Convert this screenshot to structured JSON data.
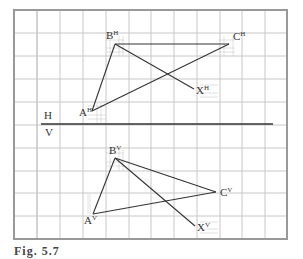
{
  "figure": {
    "colors": {
      "grid": "#c8c8c8",
      "fine_grid": "#cfcfcf",
      "frame": "#999999",
      "ink": "#333333",
      "background": "#ffffff"
    },
    "grid": {
      "x": [
        14,
        37,
        60,
        83,
        106,
        129,
        151,
        174,
        197,
        220,
        242,
        265,
        287
      ],
      "y": [
        10,
        33,
        56,
        79,
        102,
        125,
        148,
        171,
        193,
        216,
        239
      ]
    },
    "folding_line": {
      "x1": 41,
      "y1": 124,
      "x2": 273,
      "y2": 124,
      "upper_label": "H",
      "lower_label": "V"
    },
    "horizontal_view": {
      "points": {
        "A": {
          "x": 92,
          "y": 111,
          "label": "A",
          "sup": "H"
        },
        "B": {
          "x": 115,
          "y": 44,
          "label": "B",
          "sup": "H"
        },
        "C": {
          "x": 229,
          "y": 44,
          "label": "C",
          "sup": "H"
        },
        "X": {
          "x": 194,
          "y": 89,
          "label": "X",
          "sup": "H"
        }
      },
      "segments": [
        [
          "A",
          "B"
        ],
        [
          "B",
          "C"
        ],
        [
          "A",
          "C"
        ],
        [
          "B",
          "X"
        ]
      ]
    },
    "vertical_view": {
      "points": {
        "A": {
          "x": 93,
          "y": 214,
          "label": "A",
          "sup": "V"
        },
        "B": {
          "x": 115,
          "y": 158,
          "label": "B",
          "sup": "V"
        },
        "C": {
          "x": 216,
          "y": 192,
          "label": "C",
          "sup": "V"
        },
        "X": {
          "x": 195,
          "y": 226,
          "label": "X",
          "sup": "V"
        }
      },
      "segments": [
        [
          "A",
          "B"
        ],
        [
          "B",
          "C"
        ],
        [
          "A",
          "C"
        ],
        [
          "B",
          "X"
        ]
      ]
    },
    "caption": "Fig. 5.7"
  }
}
